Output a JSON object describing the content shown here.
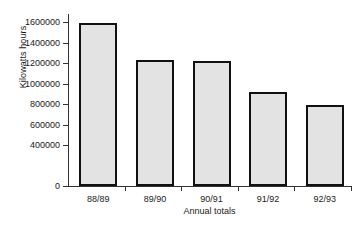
{
  "chart_data": {
    "type": "bar",
    "title": "",
    "xlabel": "Annual totals",
    "ylabel": "Kilowatts hours",
    "categories": [
      "88/89",
      "89/90",
      "90/91",
      "91/92",
      "92/93"
    ],
    "values": [
      1590000,
      1235000,
      1225000,
      920000,
      790000
    ],
    "ylim": [
      0,
      1680000
    ],
    "ytick_labels": [
      "0",
      "400000",
      "600000",
      "800000",
      "1000000",
      "1200000",
      "1400000",
      "1600000"
    ],
    "ytick_values": [
      0,
      400000,
      600000,
      800000,
      1000000,
      1200000,
      1400000,
      1600000
    ],
    "grid": false,
    "legend": "none",
    "bar_fill_color": "#e3e3e3",
    "bar_edge_color": "#111111",
    "axis_color": "#333333"
  }
}
